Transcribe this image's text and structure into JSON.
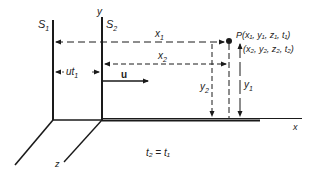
{
  "diagram": {
    "frames": {
      "s1": {
        "label": "S",
        "sub": "1"
      },
      "s2": {
        "label": "S",
        "sub": "2"
      }
    },
    "axes": {
      "y": "y",
      "x": "x",
      "z": "z"
    },
    "velocity": {
      "label": "u"
    },
    "offset": {
      "label": "ut",
      "sub": "1"
    },
    "distances": {
      "x1": {
        "label": "x",
        "sub": "1"
      },
      "x2": {
        "label": "x",
        "sub": "2"
      },
      "y1": {
        "label": "y",
        "sub": "1"
      },
      "y2": {
        "label": "y",
        "sub": "2"
      }
    },
    "point": {
      "line1": "P(x₁, y₁, z₁, t₁)",
      "line2": "(x₂, y₂, z₂, t₂)"
    },
    "equation": "t₂ = t₁",
    "colors": {
      "line": "#1a1a1a",
      "background": "#ffffff"
    }
  }
}
